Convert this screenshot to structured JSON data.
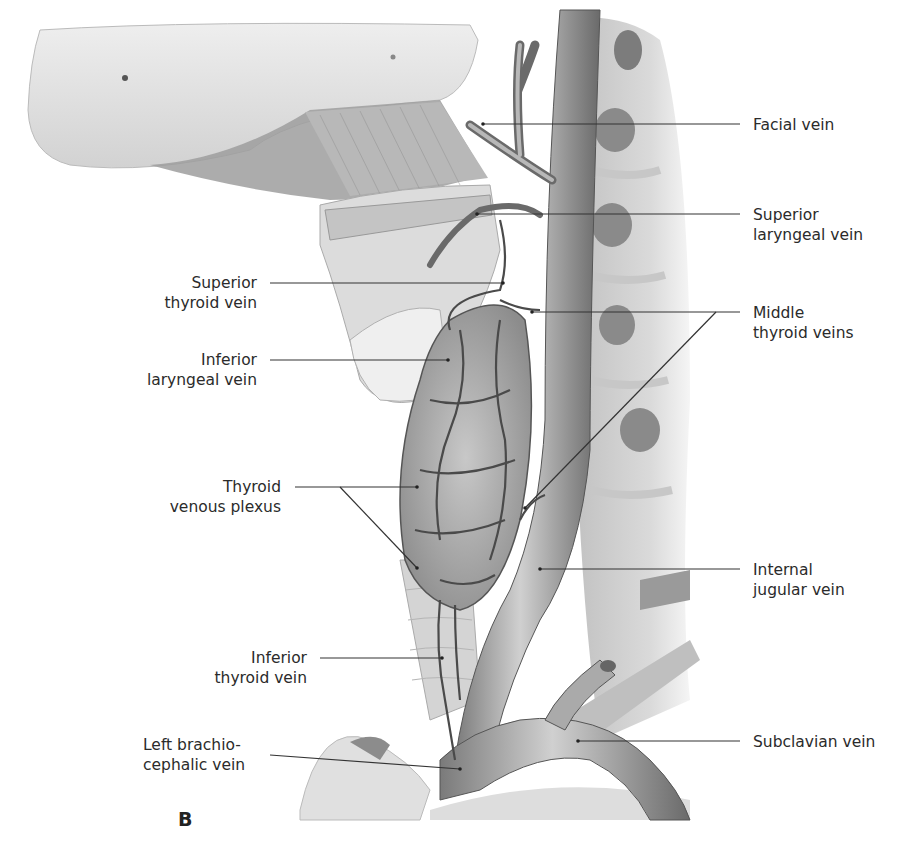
{
  "figure": {
    "panel_letter": "B"
  },
  "labels_right": [
    {
      "id": "facial-vein",
      "lines": [
        "Facial vein"
      ]
    },
    {
      "id": "superior-laryngeal-vein",
      "lines": [
        "Superior",
        "laryngeal vein"
      ]
    },
    {
      "id": "middle-thyroid-veins",
      "lines": [
        "Middle",
        "thyroid veins"
      ]
    },
    {
      "id": "internal-jugular-vein",
      "lines": [
        "Internal",
        "jugular vein"
      ]
    },
    {
      "id": "subclavian-vein",
      "lines": [
        "Subclavian vein"
      ]
    }
  ],
  "labels_left": [
    {
      "id": "superior-thyroid-vein",
      "lines": [
        "Superior",
        "thyroid vein"
      ]
    },
    {
      "id": "inferior-laryngeal-vein",
      "lines": [
        "Inferior",
        "laryngeal vein"
      ]
    },
    {
      "id": "thyroid-venous-plexus",
      "lines": [
        "Thyroid",
        "venous plexus"
      ]
    },
    {
      "id": "inferior-thyroid-vein",
      "lines": [
        "Inferior",
        "thyroid vein"
      ]
    },
    {
      "id": "left-brachiocephalic-vein",
      "lines": [
        "Left brachio-",
        "cephalic vein"
      ]
    }
  ],
  "colors": {
    "background": "#ffffff",
    "text": "#2b2b2b",
    "leader_line": "#333333",
    "bone": "#e4e4e4",
    "vein": "#9a9a9a",
    "vein_dark": "#6e6e6e",
    "muscle": "#b5b5b5",
    "thyroid": "#a8a8a8"
  }
}
